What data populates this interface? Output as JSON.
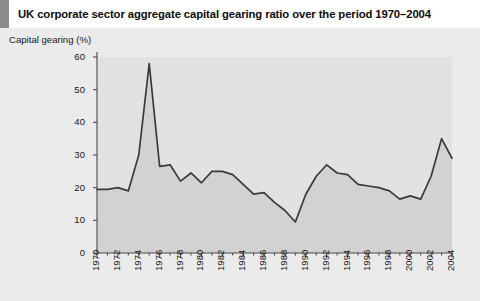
{
  "title": "UK corporate sector aggregate capital gearing ratio over the period 1970–2004",
  "colors": {
    "title_accent": "#8c8c8c",
    "page_background": "#ebebeb",
    "plot_background": "#e2e2e2",
    "area_fill": "#d2d2d2",
    "line": "#3a3a3a",
    "axis": "#4a4a4a",
    "text": "#1a1a1a"
  },
  "chart_data": {
    "type": "area",
    "title": "UK corporate sector aggregate capital gearing ratio over the period 1970–2004",
    "xlabel": "",
    "ylabel": "Capital gearing (%)",
    "ylim": [
      0,
      60
    ],
    "xlim": [
      1970,
      2004
    ],
    "ytick_values": [
      0,
      10,
      20,
      30,
      40,
      50,
      60
    ],
    "ytick_labels": [
      "0",
      "10",
      "20",
      "30",
      "40",
      "50",
      "60"
    ],
    "xtick_values": [
      1970,
      1972,
      1974,
      1976,
      1978,
      1980,
      1982,
      1984,
      1986,
      1988,
      1990,
      1992,
      1994,
      1996,
      1998,
      2000,
      2002,
      2004
    ],
    "xtick_labels": [
      "1970",
      "1972",
      "1974",
      "1976",
      "1978",
      "1980",
      "1982",
      "1984",
      "1986",
      "1988",
      "1990",
      "1992",
      "1994",
      "1996",
      "1998",
      "2000",
      "2002",
      "2004"
    ],
    "minor_xticks_every": 1,
    "grid": false,
    "legend": null,
    "x": [
      1970,
      1971,
      1972,
      1973,
      1974,
      1975,
      1976,
      1977,
      1978,
      1979,
      1980,
      1981,
      1982,
      1983,
      1984,
      1985,
      1986,
      1987,
      1988,
      1989,
      1990,
      1991,
      1992,
      1993,
      1994,
      1995,
      1996,
      1997,
      1998,
      1999,
      2000,
      2001,
      2002,
      2003,
      2004
    ],
    "values": [
      19.5,
      19.5,
      20.0,
      19.0,
      30.0,
      58.0,
      26.5,
      27.0,
      22.0,
      24.5,
      21.5,
      25.0,
      25.0,
      24.0,
      21.0,
      18.0,
      18.5,
      15.5,
      13.0,
      9.5,
      18.0,
      23.5,
      27.0,
      24.5,
      24.0,
      21.0,
      20.5,
      20.0,
      19.0,
      16.5,
      17.5,
      16.5,
      23.5,
      35.0,
      29.0
    ],
    "series_name": "Capital gearing"
  }
}
